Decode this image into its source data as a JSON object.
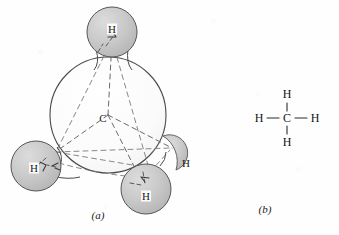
{
  "figure": {
    "molecule": "methane",
    "molecular_formula": "CH4",
    "panels": [
      {
        "id": "a",
        "caption": "(a)",
        "type": "space-filling-ball-and-stick",
        "caption_x": 98,
        "caption_y": 215
      },
      {
        "id": "b",
        "caption": "(b)",
        "type": "structural-formula",
        "caption_x": 265,
        "caption_y": 209
      }
    ]
  },
  "panel_a": {
    "carbon": {
      "label": "C",
      "cx": 108,
      "cy": 115,
      "r": 58,
      "label_x": 103,
      "label_y": 118,
      "fill": "#fdfdfd",
      "stroke": "#4a4a4a"
    },
    "hydrogens": [
      {
        "label": "H",
        "position": "top",
        "cx": 112,
        "cy": 32,
        "r": 25,
        "label_x": 112,
        "label_y": 29,
        "visible_sphere": true
      },
      {
        "label": "H",
        "position": "lower-left",
        "cx": 36,
        "cy": 166,
        "r": 25,
        "label_x": 34,
        "label_y": 168,
        "visible_sphere": true
      },
      {
        "label": "H",
        "position": "lower-right",
        "cx": 146,
        "cy": 189,
        "r": 25,
        "label_x": 146,
        "label_y": 196,
        "visible_sphere": true
      },
      {
        "label": "H",
        "position": "back-right",
        "cx": 178,
        "cy": 152,
        "r": 18,
        "label_x": 186,
        "label_y": 163,
        "visible_sphere": false
      }
    ],
    "sphere_fill": "#c9c9c9",
    "sphere_stroke": "#555555",
    "bond_style": "dashed",
    "bond_color": "#6a6a6a"
  },
  "panel_b": {
    "center_atom": {
      "label": "C",
      "x": 287,
      "y": 118
    },
    "outer_atoms": [
      {
        "label": "H",
        "x": 287,
        "y": 94,
        "direction": "up"
      },
      {
        "label": "H",
        "x": 287,
        "y": 142,
        "direction": "down"
      },
      {
        "label": "H",
        "x": 259,
        "y": 118,
        "direction": "left"
      },
      {
        "label": "H",
        "x": 315,
        "y": 118,
        "direction": "right"
      }
    ],
    "bond_color": "#2a2a2a",
    "bond_count": 4
  },
  "colors": {
    "background": "#fefefe",
    "ink": "#1a1a1a",
    "sphere_gray": "#c9c9c9",
    "outline_gray": "#555555",
    "dash_gray": "#6a6a6a"
  }
}
